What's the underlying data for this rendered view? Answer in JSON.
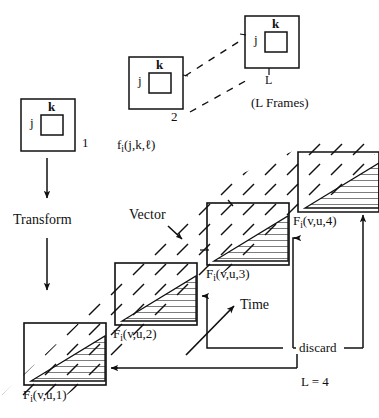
{
  "figure": {
    "title_semantics": "vector-transform-frame-buffer-diagram",
    "colors": {
      "ink": "#101010",
      "paper": "#ffffff"
    }
  },
  "frames_row": {
    "inner_label_j": "j",
    "inner_label_k": "k",
    "frames": [
      {
        "id": "frame-1",
        "index_label": "1",
        "j": "j",
        "k": "k"
      },
      {
        "id": "frame-2",
        "index_label": "2",
        "j": "j",
        "k": "k"
      },
      {
        "id": "frame-L",
        "index_label": "L",
        "j": "j",
        "k": "k"
      }
    ],
    "frames_caption": "(L Frames)",
    "signal_label": "f",
    "signal_sub": "i",
    "signal_args": "(j,k,ℓ)"
  },
  "transform": {
    "label": "Transform",
    "arrow_in_name": "arrow-down-into-transform",
    "arrow_out_name": "arrow-down-out-of-transform"
  },
  "vector": {
    "label": "Vector",
    "pointer_name": "vector-pointer-arrow"
  },
  "time": {
    "label": "Time",
    "pointer_name": "time-arrow"
  },
  "buffers": [
    {
      "id": "buffer-1",
      "label": "F",
      "sub": "i",
      "args": "(v,u,1)"
    },
    {
      "id": "buffer-2",
      "label": "F",
      "sub": "i",
      "args": "(v,u,2)"
    },
    {
      "id": "buffer-3",
      "label": "F",
      "sub": "i",
      "args": "(v,u,3)"
    },
    {
      "id": "buffer-4",
      "label": "F",
      "sub": "i",
      "args": "(v,u,4)"
    }
  ],
  "feedback": {
    "discard_label": "discard",
    "capacity_label": "L = 4"
  }
}
